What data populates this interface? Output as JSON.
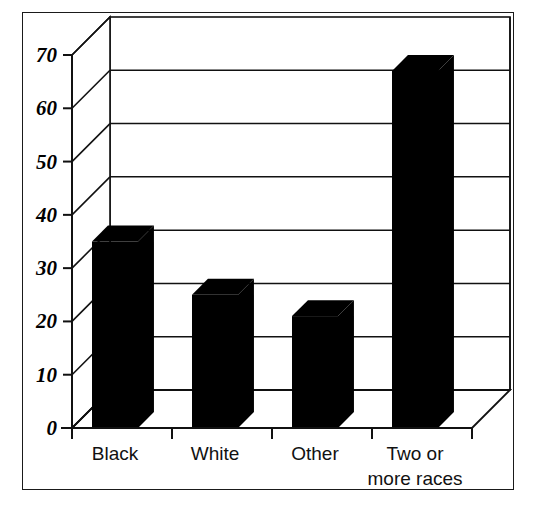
{
  "chart_data": {
    "type": "bar",
    "title": "",
    "subtitle": "",
    "xlabel": "",
    "ylabel": "",
    "categories": [
      "Black",
      "White",
      "Other",
      "Two or more races"
    ],
    "category_lines": [
      [
        "Black"
      ],
      [
        "White"
      ],
      [
        "Other"
      ],
      [
        "Two or",
        "more races"
      ]
    ],
    "values": [
      35,
      25,
      21,
      67
    ],
    "ylim": [
      0,
      70
    ],
    "yticks": [
      0,
      10,
      20,
      30,
      40,
      50,
      60,
      70
    ],
    "ytick_labels": [
      "0",
      "10",
      "20",
      "30",
      "40",
      "50",
      "60",
      "70"
    ],
    "grid": true,
    "grid_axis": "y",
    "legend": false,
    "legend_position": "none",
    "style": "3d-column",
    "bar_color": "#000000",
    "frame_color": "#1a1a1a",
    "background_color": "#ffffff"
  },
  "figure": {
    "border_label": "chart-frame"
  }
}
